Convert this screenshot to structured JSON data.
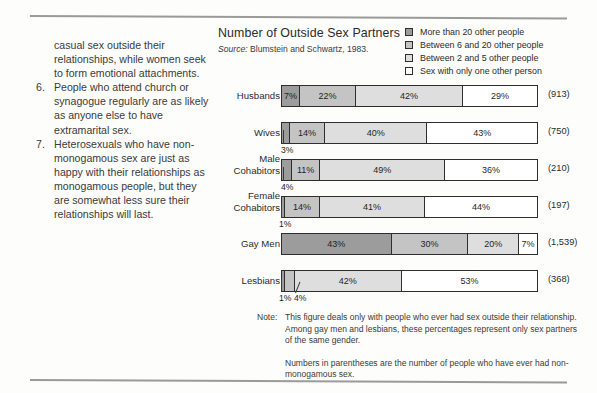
{
  "left_column": {
    "continuation": "casual sex outside their relationships, while women seek to form emotional attachments.",
    "items": [
      {
        "num": "6.",
        "text": "People who attend church or synagogue regularly are as likely as anyone else to have extramarital sex."
      },
      {
        "num": "7.",
        "text": "Heterosexuals who have non-monogamous sex are just as happy with their relationships as monogamous people, but they are somewhat less sure their relationships will last."
      }
    ]
  },
  "chart": {
    "title": "Number of Outside Sex Partners",
    "source_prefix": "Source:",
    "source_text": "Blumstein and Schwartz, 1983.",
    "legend": [
      {
        "label": "More than 20 other people",
        "color": "#9c9c9c",
        "swatch_name": "legend-swatch-more-than-20"
      },
      {
        "label": "Between 6 and 20 other people",
        "color": "#c4c4c4",
        "swatch_name": "legend-swatch-6-to-20"
      },
      {
        "label": "Between 2 and 5 other people",
        "color": "#dedede",
        "swatch_name": "legend-swatch-2-to-5"
      },
      {
        "label": "Sex with only one other person",
        "color": "#ffffff",
        "swatch_name": "legend-swatch-one-person"
      }
    ]
  },
  "chart_data": {
    "type": "bar",
    "orientation": "horizontal",
    "stacked": true,
    "normalized_percent": true,
    "title": "Number of Outside Sex Partners",
    "subtitle": "Source: Blumstein and Schwartz, 1983.",
    "xlabel": "",
    "ylabel": "",
    "xlim": [
      0,
      100
    ],
    "grid": false,
    "legend_position": "top-right",
    "categories": [
      "Husbands",
      "Wives",
      "Male Cohabitors",
      "Female Cohabitors",
      "Gay Men",
      "Lesbians"
    ],
    "series": [
      {
        "name": "More than 20 other people",
        "color": "#9c9c9c",
        "values": [
          7,
          3,
          4,
          1,
          43,
          1
        ]
      },
      {
        "name": "Between 6 and 20 other people",
        "color": "#c4c4c4",
        "values": [
          22,
          14,
          11,
          14,
          30,
          4
        ]
      },
      {
        "name": "Between 2 and 5 other people",
        "color": "#dedede",
        "values": [
          42,
          40,
          49,
          41,
          20,
          42
        ]
      },
      {
        "name": "Sex with only one other person",
        "color": "#ffffff",
        "values": [
          29,
          43,
          36,
          44,
          7,
          53
        ]
      }
    ],
    "annotations": [
      "(913)",
      "(750)",
      "(210)",
      "(197)",
      "(1,539)",
      "(368)"
    ]
  },
  "rows": [
    {
      "label": "Husbands",
      "label_lines": [
        "Husbands"
      ],
      "count": "(913)",
      "segments": [
        {
          "pct": 7,
          "label": "7%",
          "color": "#9c9c9c",
          "show": true
        },
        {
          "pct": 22,
          "label": "22%",
          "color": "#c4c4c4",
          "show": true
        },
        {
          "pct": 42,
          "label": "42%",
          "color": "#dedede",
          "show": true
        },
        {
          "pct": 29,
          "label": "29%",
          "color": "#ffffff",
          "show": true
        }
      ],
      "callouts": []
    },
    {
      "label": "Wives",
      "label_lines": [
        "Wives"
      ],
      "count": "(750)",
      "segments": [
        {
          "pct": 3,
          "label": "3%",
          "color": "#9c9c9c",
          "show": false
        },
        {
          "pct": 14,
          "label": "14%",
          "color": "#c4c4c4",
          "show": true
        },
        {
          "pct": 40,
          "label": "40%",
          "color": "#dedede",
          "show": true
        },
        {
          "pct": 43,
          "label": "43%",
          "color": "#ffffff",
          "show": true
        }
      ],
      "callouts": [
        {
          "text": "3%",
          "left": 63
        }
      ]
    },
    {
      "label": "Male Cohabitors",
      "label_lines": [
        "Male",
        "Cohabitors"
      ],
      "count": "(210)",
      "segments": [
        {
          "pct": 4,
          "label": "4%",
          "color": "#9c9c9c",
          "show": false
        },
        {
          "pct": 11,
          "label": "11%",
          "color": "#c4c4c4",
          "show": true
        },
        {
          "pct": 49,
          "label": "49%",
          "color": "#dedede",
          "show": true
        },
        {
          "pct": 36,
          "label": "36%",
          "color": "#ffffff",
          "show": true
        }
      ],
      "callouts": [
        {
          "text": "4%",
          "left": 63
        }
      ]
    },
    {
      "label": "Female Cohabitors",
      "label_lines": [
        "Female",
        "Cohabitors"
      ],
      "count": "(197)",
      "segments": [
        {
          "pct": 1,
          "label": "1%",
          "color": "#9c9c9c",
          "show": false
        },
        {
          "pct": 14,
          "label": "14%",
          "color": "#c4c4c4",
          "show": true
        },
        {
          "pct": 41,
          "label": "41%",
          "color": "#dedede",
          "show": true
        },
        {
          "pct": 44,
          "label": "44%",
          "color": "#ffffff",
          "show": true
        }
      ],
      "callouts": [
        {
          "text": "1%",
          "left": 61
        }
      ]
    },
    {
      "label": "Gay Men",
      "label_lines": [
        "Gay Men"
      ],
      "count": "(1,539)",
      "segments": [
        {
          "pct": 43,
          "label": "43%",
          "color": "#9c9c9c",
          "show": true
        },
        {
          "pct": 30,
          "label": "30%",
          "color": "#c4c4c4",
          "show": true
        },
        {
          "pct": 20,
          "label": "20%",
          "color": "#dedede",
          "show": true
        },
        {
          "pct": 7,
          "label": "7%",
          "color": "#ffffff",
          "show": true
        }
      ],
      "callouts": []
    },
    {
      "label": "Lesbians",
      "label_lines": [
        "Lesbians"
      ],
      "count": "(368)",
      "segments": [
        {
          "pct": 1,
          "label": "1%",
          "color": "#9c9c9c",
          "show": false
        },
        {
          "pct": 4,
          "label": "4%",
          "color": "#c4c4c4",
          "show": false
        },
        {
          "pct": 42,
          "label": "42%",
          "color": "#dedede",
          "show": true
        },
        {
          "pct": 53,
          "label": "53%",
          "color": "#ffffff",
          "show": true
        }
      ],
      "callouts": [
        {
          "text": "1%",
          "left": 61
        },
        {
          "text": "4%",
          "left": 76
        }
      ]
    }
  ],
  "notes": {
    "note_tag": "Note:",
    "note_text": "This figure deals only with people who ever had sex outside their relationship. Among gay men and lesbians, these percentages represent only sex partners of the same gender.",
    "note_text2": "Numbers in parentheses are the number of people who have ever had non-monogamous sex."
  }
}
